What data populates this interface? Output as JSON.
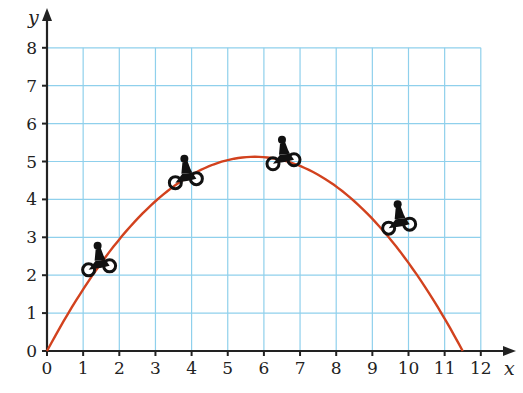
{
  "chart_data": {
    "type": "line",
    "title": "",
    "xlabel": "x",
    "ylabel": "y",
    "xlim": [
      0,
      12
    ],
    "ylim": [
      0,
      8
    ],
    "x_ticks": [
      "0",
      "1",
      "2",
      "3",
      "4",
      "5",
      "6",
      "7",
      "8",
      "9",
      "10",
      "11",
      "12"
    ],
    "y_ticks": [
      "0",
      "1",
      "2",
      "3",
      "4",
      "5",
      "6",
      "7",
      "8"
    ],
    "grid": true,
    "series": [
      {
        "name": "trajectory",
        "color": "#d2421e",
        "x": [
          0,
          1,
          2,
          3,
          4,
          5,
          5.75,
          6,
          7,
          8,
          9,
          10,
          11,
          11.5
        ],
        "y": [
          0,
          1.78,
          2.95,
          3.95,
          4.65,
          5.06,
          5.12,
          5.12,
          4.88,
          4.34,
          3.49,
          2.33,
          0.85,
          0
        ]
      }
    ],
    "annotations": [
      {
        "type": "motorbike-icon",
        "x": 1.4,
        "y": 2.3
      },
      {
        "type": "motorbike-icon",
        "x": 3.8,
        "y": 4.6
      },
      {
        "type": "motorbike-icon",
        "x": 6.5,
        "y": 5.1
      },
      {
        "type": "motorbike-icon",
        "x": 9.7,
        "y": 3.4
      }
    ]
  },
  "colors": {
    "grid": "#8fd0ec",
    "axis": "#222222",
    "curve": "#d2421e"
  }
}
